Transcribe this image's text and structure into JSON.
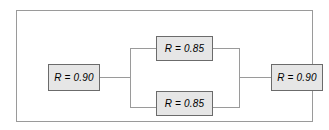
{
  "diagram": {
    "frame": {
      "border_color": "#9a9a9a"
    },
    "style": {
      "block_fill": "#e6e6e6",
      "block_border": "#6b6b6b",
      "wire_color": "#9a9a9a",
      "text_color": "#000000",
      "background": "#ffffff"
    },
    "blocks": [
      {
        "id": "left",
        "label": "R = 0.90",
        "symbol": "R",
        "value": "0.90",
        "position": "series-input"
      },
      {
        "id": "top",
        "label": "R = 0.85",
        "symbol": "R",
        "value": "0.85",
        "position": "parallel-upper"
      },
      {
        "id": "bottom",
        "label": "R = 0.85",
        "symbol": "R",
        "value": "0.85",
        "position": "parallel-lower"
      },
      {
        "id": "right",
        "label": "R = 0.90",
        "symbol": "R",
        "value": "0.90",
        "position": "series-output"
      }
    ],
    "connections": [
      {
        "from": "left",
        "to": "split-bus",
        "type": "horizontal"
      },
      {
        "from": "split-bus",
        "to": "top",
        "type": "branch-upper"
      },
      {
        "from": "split-bus",
        "to": "bottom",
        "type": "branch-lower"
      },
      {
        "from": "top",
        "to": "merge-bus",
        "type": "branch-upper"
      },
      {
        "from": "bottom",
        "to": "merge-bus",
        "type": "branch-lower"
      },
      {
        "from": "merge-bus",
        "to": "right",
        "type": "horizontal"
      }
    ]
  }
}
